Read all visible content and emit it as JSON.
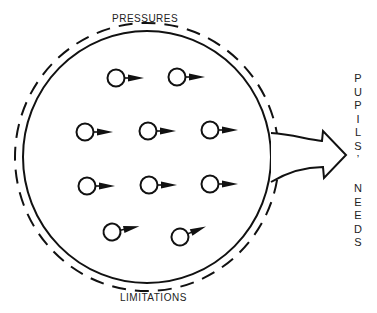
{
  "diagram": {
    "top_label": "PRESSURES",
    "bottom_label": "LIMITATIONS",
    "output_label_line1": [
      "P",
      "U",
      "P",
      "I",
      "L",
      "S",
      "’"
    ],
    "output_label_line2": [
      "N",
      "E",
      "E",
      "D",
      "S"
    ],
    "output_label": "PUPILS' NEEDS",
    "element_count": 10,
    "element_description": "pupil (circle with arrow pointing right)",
    "outer_boundary": "dashed",
    "inner_boundary": "solid",
    "colors": {
      "ink": "#111111",
      "background": "#ffffff"
    }
  }
}
